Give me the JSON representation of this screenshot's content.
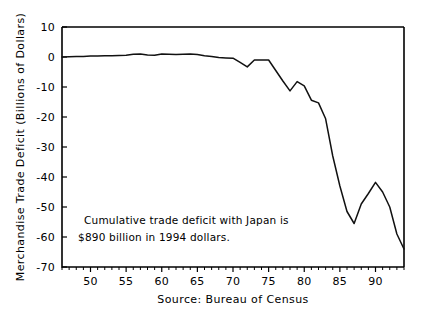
{
  "chart_data": {
    "type": "line",
    "title": "",
    "xlabel": "Source: Bureau of Census",
    "ylabel": "Merchandise Trade Deficit (Billions of Dollars)",
    "xlim": [
      1946,
      1994
    ],
    "ylim": [
      -70,
      10
    ],
    "grid": false,
    "legend": "none",
    "x_tick_labels": [
      "50",
      "55",
      "60",
      "65",
      "70",
      "75",
      "80",
      "85",
      "90"
    ],
    "x_tick_values": [
      1950,
      1955,
      1960,
      1965,
      1970,
      1975,
      1980,
      1985,
      1990
    ],
    "x_minor_step": 1,
    "y_tick_labels": [
      "10",
      "0",
      "-10",
      "-20",
      "-30",
      "-40",
      "-50",
      "-60",
      "-70"
    ],
    "y_tick_values": [
      10,
      0,
      -10,
      -20,
      -30,
      -40,
      -50,
      -60,
      -70
    ],
    "line_color": "#111111",
    "x": [
      1946,
      1947,
      1948,
      1949,
      1950,
      1951,
      1952,
      1953,
      1954,
      1955,
      1956,
      1957,
      1958,
      1959,
      1960,
      1961,
      1962,
      1963,
      1964,
      1965,
      1966,
      1967,
      1968,
      1969,
      1970,
      1971,
      1972,
      1973,
      1974,
      1975,
      1976,
      1977,
      1978,
      1979,
      1980,
      1981,
      1982,
      1983,
      1984,
      1985,
      1986,
      1987,
      1988,
      1989,
      1990,
      1991,
      1992,
      1993,
      1994
    ],
    "values": [
      0.0,
      0.1,
      0.2,
      0.2,
      0.3,
      0.3,
      0.4,
      0.4,
      0.5,
      0.6,
      0.9,
      1.0,
      0.7,
      0.6,
      1.0,
      0.9,
      0.8,
      0.9,
      1.0,
      0.8,
      0.4,
      0.2,
      -0.2,
      -0.3,
      -0.4,
      -1.8,
      -3.3,
      -1.0,
      -1.0,
      -1.0,
      -4.5,
      -8.0,
      -11.3,
      -8.2,
      -9.6,
      -14.4,
      -15.3,
      -20.6,
      -33.0,
      -43.0,
      -51.5,
      -55.5,
      -49.0,
      -45.5,
      -41.8,
      -45.0,
      -50.0,
      -59.0,
      -64.0
    ],
    "annotation": {
      "line1": "Cumulative trade deficit with Japan is",
      "line2": "$890 billion in 1994 dollars."
    }
  }
}
